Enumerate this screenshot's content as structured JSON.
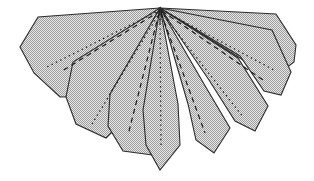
{
  "figure": {
    "canvas": {
      "width": 314,
      "height": 181
    },
    "background_color": "#ffffff",
    "apex": {
      "x": 160,
      "y": 8,
      "label": "apex"
    },
    "colors": {
      "fill": "#dcdcdc",
      "halftone_dot": "#9a9a9a",
      "outline": "#2b2b2b",
      "crease": "#1a1a1a",
      "background": "#ffffff"
    },
    "stroke_widths": {
      "outline": 1.1,
      "crease_dashed": 1.2,
      "crease_dotted": 1.2
    },
    "petal_count": 8,
    "crease_count": 8
  },
  "petals": [
    {
      "id": "petal-1",
      "name": "far-left-panel",
      "order": 1,
      "points": "160,8 38,17 20,47 34,73 60,97 132,96 160,8",
      "fill": "#dcdcdc",
      "stroke": "#2b2b2b"
    },
    {
      "id": "petal-2",
      "name": "left-outer-panel",
      "order": 2,
      "points": "160,8 73,62 66,97 76,124 106,138 150,95 160,8",
      "fill": "#dcdcdc",
      "stroke": "#2b2b2b"
    },
    {
      "id": "petal-3",
      "name": "left-middle-panel",
      "order": 3,
      "points": "160,8 110,94 108,126 123,151 152,155 166,100 160,8",
      "fill": "#dcdcdc",
      "stroke": "#2b2b2b"
    },
    {
      "id": "petal-4",
      "name": "left-inner-panel",
      "order": 4,
      "points": "160,8 143,110 146,145 160,170 180,145 178,104 160,8",
      "fill": "#dcdcdc",
      "stroke": "#2b2b2b"
    },
    {
      "id": "petal-5",
      "name": "right-inner-panel",
      "order": 5,
      "points": "160,8 188,104 196,140 214,153 230,128 204,84 160,8",
      "fill": "#dcdcdc",
      "stroke": "#2b2b2b"
    },
    {
      "id": "petal-6",
      "name": "right-middle-panel",
      "order": 6,
      "points": "160,8 209,80 235,121 255,131 268,106 238,58 160,8",
      "fill": "#dcdcdc",
      "stroke": "#2b2b2b"
    },
    {
      "id": "petal-7",
      "name": "right-outer-panel",
      "order": 7,
      "points": "160,8 240,56 264,91 281,95 291,72 272,30 160,8",
      "fill": "#dcdcdc",
      "stroke": "#2b2b2b"
    },
    {
      "id": "petal-8",
      "name": "far-right-panel",
      "order": 8,
      "points": "160,8 276,14 296,45 294,62 272,79 248,63 160,8",
      "fill": "#dcdcdc",
      "stroke": "#2b2b2b"
    }
  ],
  "creases": [
    {
      "id": "crease-1",
      "name": "crease-far-left-dotted",
      "style": "dotted",
      "dash_array": "1.4 3.4",
      "from": {
        "x": 160,
        "y": 10
      },
      "to": {
        "x": 47,
        "y": 67
      },
      "stroke": "#1a1a1a"
    },
    {
      "id": "crease-2",
      "name": "crease-left-outer-dashed",
      "style": "dashed",
      "dash_array": "5 4",
      "from": {
        "x": 160,
        "y": 11
      },
      "to": {
        "x": 62,
        "y": 71
      },
      "stroke": "#1a1a1a"
    },
    {
      "id": "crease-3",
      "name": "crease-left-middle-dotted",
      "style": "dotted",
      "dash_array": "1.4 3.4",
      "from": {
        "x": 160,
        "y": 12
      },
      "to": {
        "x": 92,
        "y": 124
      },
      "stroke": "#1a1a1a"
    },
    {
      "id": "crease-4",
      "name": "crease-left-inner-dashed",
      "style": "dashed",
      "dash_array": "5 4",
      "from": {
        "x": 159,
        "y": 13
      },
      "to": {
        "x": 128,
        "y": 135
      },
      "stroke": "#1a1a1a"
    },
    {
      "id": "crease-5",
      "name": "crease-center-dotted",
      "style": "dotted",
      "dash_array": "1.4 3.4",
      "from": {
        "x": 160,
        "y": 14
      },
      "to": {
        "x": 161,
        "y": 148
      },
      "stroke": "#1a1a1a"
    },
    {
      "id": "crease-6",
      "name": "crease-right-inner-dashed",
      "style": "dashed",
      "dash_array": "5 4",
      "from": {
        "x": 161,
        "y": 13
      },
      "to": {
        "x": 205,
        "y": 133
      },
      "stroke": "#1a1a1a"
    },
    {
      "id": "crease-7",
      "name": "crease-right-middle-dotted",
      "style": "dotted",
      "dash_array": "1.4 3.4",
      "from": {
        "x": 161,
        "y": 12
      },
      "to": {
        "x": 243,
        "y": 117
      },
      "stroke": "#1a1a1a"
    },
    {
      "id": "crease-8",
      "name": "crease-right-outer-dashed",
      "style": "dashed",
      "dash_array": "5 4",
      "from": {
        "x": 162,
        "y": 11
      },
      "to": {
        "x": 266,
        "y": 82
      },
      "stroke": "#1a1a1a"
    },
    {
      "id": "crease-9",
      "name": "crease-far-right-dotted",
      "style": "dotted",
      "dash_array": "1.4 3.4",
      "from": {
        "x": 162,
        "y": 10
      },
      "to": {
        "x": 274,
        "y": 70
      },
      "stroke": "#1a1a1a"
    }
  ],
  "apex_ridges": [
    {
      "id": "ridge-1",
      "name": "apex-ridge-left",
      "from": {
        "x": 160,
        "y": 8
      },
      "to": {
        "x": 152,
        "y": 22
      }
    },
    {
      "id": "ridge-2",
      "name": "apex-ridge-center",
      "from": {
        "x": 160,
        "y": 8
      },
      "to": {
        "x": 160,
        "y": 24
      }
    },
    {
      "id": "ridge-3",
      "name": "apex-ridge-right",
      "from": {
        "x": 161,
        "y": 8
      },
      "to": {
        "x": 169,
        "y": 21
      }
    }
  ]
}
